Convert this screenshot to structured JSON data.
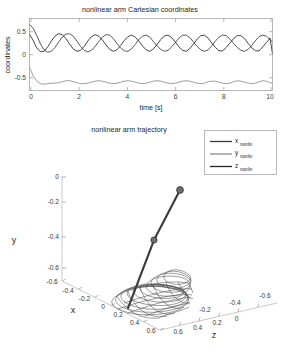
{
  "figure": {
    "width": 281,
    "height": 356
  },
  "top_plot": {
    "title": "nonlinear arm Cartesian coordinates",
    "xlabel": "time [s]",
    "ylabel": "coordinates",
    "xticks": [
      "0",
      "2",
      "4",
      "6",
      "8",
      "10"
    ],
    "yticks": [
      "0.5",
      "0",
      "-0.5"
    ]
  },
  "legend": {
    "items": [
      {
        "base": "x",
        "sub": "nonlin",
        "color": "#3b3b3b"
      },
      {
        "base": "y",
        "sub": "nonlin",
        "color": "#8c8c8c"
      },
      {
        "base": "z",
        "sub": "nonlin",
        "color": "#262626"
      }
    ]
  },
  "bottom_plot": {
    "title": "nonlinear arm trajectory",
    "xlabel": "x",
    "ylabel": "y",
    "zlabel": "z",
    "xticks": [
      "-0.6",
      "-0.4",
      "-0.2",
      "0",
      "0.2",
      "0.4",
      "0.6"
    ],
    "yticks": [
      "0",
      "-0.2",
      "-0.4",
      "-0.6"
    ],
    "zticks": [
      "0.6",
      "0.4",
      "0.2",
      "0",
      "-0.2",
      "-0.4",
      "-0.6"
    ]
  },
  "chart_data": [
    {
      "type": "line",
      "title": "nonlinear arm Cartesian coordinates",
      "xlabel": "time [s]",
      "ylabel": "coordinates",
      "xlim": [
        0,
        10
      ],
      "ylim": [
        -0.85,
        0.62
      ],
      "grid": false,
      "legend_position": "outside-below-right",
      "series": [
        {
          "name": "x_nonlin",
          "color": "#3b3b3b",
          "x": [
            0,
            0.15,
            0.3,
            0.45,
            0.6,
            0.75,
            0.9,
            1.05,
            1.2,
            1.35,
            1.5,
            1.65,
            1.8,
            1.95,
            2.1,
            2.25,
            2.4,
            2.55,
            2.7,
            2.85,
            3,
            3.15,
            3.3,
            3.45,
            3.6,
            3.75,
            3.9,
            4.05,
            4.2,
            4.35,
            4.5,
            4.65,
            4.8,
            4.95,
            5.1,
            5.25,
            5.4,
            5.55,
            5.7,
            5.85,
            6,
            6.15,
            6.3,
            6.45,
            6.6,
            6.75,
            6.9,
            7.05,
            7.2,
            7.35,
            7.5,
            7.65,
            7.8,
            7.95,
            8.1,
            8.25,
            8.4,
            8.55,
            8.7,
            8.85,
            9,
            9.15,
            9.3,
            9.45,
            9.6,
            9.75,
            9.9,
            10
          ],
          "y": [
            0.5,
            0.42,
            0.27,
            0.1,
            -0.02,
            -0.07,
            -0.05,
            0.03,
            0.14,
            0.24,
            0.3,
            0.31,
            0.26,
            0.16,
            0.05,
            -0.03,
            -0.06,
            -0.03,
            0.05,
            0.15,
            0.24,
            0.29,
            0.28,
            0.21,
            0.11,
            0.02,
            -0.04,
            -0.05,
            0.0,
            0.09,
            0.19,
            0.26,
            0.28,
            0.24,
            0.15,
            0.06,
            -0.01,
            -0.05,
            -0.03,
            0.04,
            0.13,
            0.22,
            0.28,
            0.28,
            0.23,
            0.14,
            0.05,
            -0.02,
            -0.05,
            -0.02,
            0.06,
            0.16,
            0.24,
            0.28,
            0.27,
            0.2,
            0.11,
            0.03,
            -0.03,
            -0.05,
            -0.01,
            0.07,
            0.17,
            0.25,
            0.28,
            0.26,
            0.19,
            0.14
          ]
        },
        {
          "name": "y_nonlin",
          "color": "#8c8c8c",
          "x": [
            0,
            0.15,
            0.3,
            0.45,
            0.6,
            0.75,
            0.9,
            1.05,
            1.2,
            1.35,
            1.5,
            1.65,
            1.8,
            1.95,
            2.1,
            2.25,
            2.4,
            2.55,
            2.7,
            2.85,
            3,
            3.15,
            3.3,
            3.45,
            3.6,
            3.75,
            3.9,
            4.05,
            4.2,
            4.35,
            4.5,
            4.65,
            4.8,
            4.95,
            5.1,
            5.25,
            5.4,
            5.55,
            5.7,
            5.85,
            6,
            6.15,
            6.3,
            6.45,
            6.6,
            6.75,
            6.9,
            7.05,
            7.2,
            7.35,
            7.5,
            7.65,
            7.8,
            7.95,
            8.1,
            8.25,
            8.4,
            8.55,
            8.7,
            8.85,
            9,
            9.15,
            9.3,
            9.45,
            9.6,
            9.75,
            9.9,
            10
          ],
          "y": [
            -0.38,
            -0.55,
            -0.66,
            -0.71,
            -0.72,
            -0.71,
            -0.7,
            -0.7,
            -0.69,
            -0.67,
            -0.65,
            -0.65,
            -0.67,
            -0.69,
            -0.71,
            -0.71,
            -0.7,
            -0.68,
            -0.66,
            -0.65,
            -0.66,
            -0.68,
            -0.7,
            -0.71,
            -0.7,
            -0.68,
            -0.66,
            -0.65,
            -0.66,
            -0.68,
            -0.7,
            -0.71,
            -0.7,
            -0.68,
            -0.66,
            -0.65,
            -0.66,
            -0.68,
            -0.7,
            -0.71,
            -0.7,
            -0.68,
            -0.66,
            -0.65,
            -0.66,
            -0.68,
            -0.7,
            -0.71,
            -0.7,
            -0.67,
            -0.66,
            -0.66,
            -0.68,
            -0.7,
            -0.71,
            -0.7,
            -0.67,
            -0.65,
            -0.66,
            -0.68,
            -0.7,
            -0.71,
            -0.7,
            -0.67,
            -0.65,
            -0.66,
            -0.69,
            -0.7
          ]
        },
        {
          "name": "z_nonlin",
          "color": "#262626",
          "x": [
            0,
            0.15,
            0.3,
            0.45,
            0.6,
            0.75,
            0.9,
            1.05,
            1.2,
            1.35,
            1.5,
            1.65,
            1.8,
            1.95,
            2.1,
            2.25,
            2.4,
            2.55,
            2.7,
            2.85,
            3,
            3.15,
            3.3,
            3.45,
            3.6,
            3.75,
            3.9,
            4.05,
            4.2,
            4.35,
            4.5,
            4.65,
            4.8,
            4.95,
            5.1,
            5.25,
            5.4,
            5.55,
            5.7,
            5.85,
            6,
            6.15,
            6.3,
            6.45,
            6.6,
            6.75,
            6.9,
            7.05,
            7.2,
            7.35,
            7.5,
            7.65,
            7.8,
            7.95,
            8.1,
            8.25,
            8.4,
            8.55,
            8.7,
            8.85,
            9,
            9.15,
            9.3,
            9.45,
            9.6,
            9.75,
            9.9,
            10
          ],
          "y": [
            0.3,
            0.17,
            0.02,
            -0.06,
            -0.05,
            0.04,
            0.16,
            0.26,
            0.31,
            0.29,
            0.21,
            0.1,
            0.0,
            -0.05,
            -0.03,
            0.05,
            0.16,
            0.25,
            0.29,
            0.26,
            0.18,
            0.08,
            -0.01,
            -0.05,
            -0.02,
            0.07,
            0.17,
            0.25,
            0.28,
            0.24,
            0.16,
            0.06,
            -0.02,
            -0.05,
            0.0,
            0.09,
            0.19,
            0.26,
            0.28,
            0.23,
            0.14,
            0.04,
            -0.03,
            -0.05,
            0.01,
            0.1,
            0.2,
            0.27,
            0.28,
            0.22,
            0.12,
            0.03,
            -0.04,
            -0.04,
            0.03,
            0.12,
            0.21,
            0.27,
            0.27,
            0.21,
            0.11,
            0.02,
            -0.04,
            -0.04,
            0.04,
            0.13,
            0.22,
            -0.1
          ]
        }
      ]
    },
    {
      "type": "line",
      "title": "nonlinear arm trajectory",
      "projection": "3d",
      "xlabel": "x",
      "ylabel": "y",
      "zlabel": "z",
      "xlim": [
        -0.7,
        0.7
      ],
      "ylim": [
        -0.7,
        0.05
      ],
      "zlim": [
        -0.7,
        0.7
      ],
      "grid": false,
      "description": "3D end-effector trajectory loops with two-link arm drawn from base to joint to tip"
    }
  ]
}
